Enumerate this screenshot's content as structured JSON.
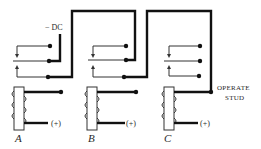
{
  "diagram": {
    "type": "relay-wiring",
    "labels": {
      "dc_supply": "− DC",
      "operate_stud_line1": "OPERATE",
      "operate_stud_line2": "STUD"
    },
    "relays": [
      {
        "id": "A",
        "label": "A",
        "coil_supply": "(+)"
      },
      {
        "id": "B",
        "label": "B",
        "coil_supply": "(+)"
      },
      {
        "id": "C",
        "label": "C",
        "coil_supply": "(+)"
      }
    ],
    "colors": {
      "line": "#111111",
      "background": "#ffffff"
    }
  }
}
